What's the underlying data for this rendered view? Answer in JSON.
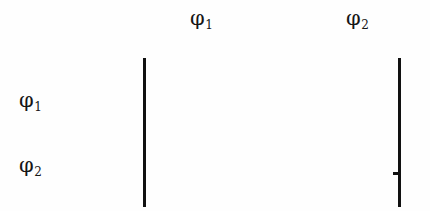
{
  "figure": {
    "background_color": "#fefefe",
    "stroke_color": "#111111",
    "width": 430,
    "height": 211,
    "labels": {
      "top_left": {
        "symbol": "φ",
        "subscript": "1"
      },
      "top_right": {
        "symbol": "φ",
        "subscript": "2"
      },
      "side_upper": {
        "symbol": "φ",
        "subscript": "1"
      },
      "side_lower": {
        "symbol": "φ",
        "subscript": "2"
      }
    },
    "bars": [
      {
        "name": "left-bar",
        "x": 143,
        "y": 58,
        "height": 149,
        "thickness": 3
      },
      {
        "name": "right-bar",
        "x": 398,
        "y": 58,
        "height": 149,
        "thickness": 3
      }
    ],
    "tick": {
      "name": "right-bar-tick",
      "x": 393,
      "y": 172,
      "width": 6,
      "height": 3
    }
  }
}
